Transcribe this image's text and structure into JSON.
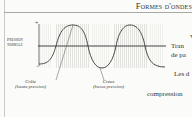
{
  "header": {
    "running_head": "Formes d'ondes"
  },
  "diagram": {
    "y_axis_label_line1": "Pression",
    "y_axis_label_line2": "normale",
    "plus_sign": "+",
    "minus_sign": "−",
    "crest_caption_line1": "Crête",
    "crest_caption_line2": "(haute pression)",
    "trough_caption_line1": "Creux",
    "trough_caption_line2": "(basse pression)",
    "colors": {
      "wave": "#4a4a4a",
      "axis": "#2f2f2f",
      "shading": "#d8d8d4"
    }
  },
  "body_text": {
    "line1": "V",
    "line2": "Tran",
    "line3": "de pa",
    "line4": "Les d",
    "line5": "compression"
  }
}
